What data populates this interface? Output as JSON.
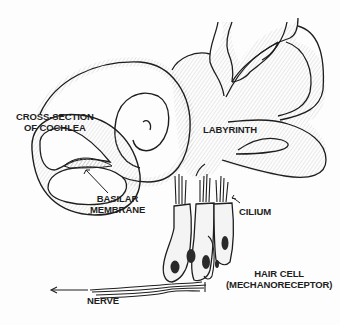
{
  "diagram": {
    "style": "hand-drawn pencil sketch",
    "colors": {
      "line": "#1e1e1e",
      "shading": "#c8c8c8",
      "background": "#fdfdfd"
    },
    "labels": {
      "cross_section": {
        "line1": "CROSS-SECTION",
        "line2": "OF COCHLEA"
      },
      "basilar": {
        "line1": "BASILAR",
        "line2": "MEMBRANE"
      },
      "labyrinth": "LABYRINTH",
      "cilium": "CILIUM",
      "hair_cell": {
        "line1": "HAIR CELL",
        "line2": "(MECHANORECEPTOR)"
      },
      "nerve": "NERVE"
    }
  }
}
